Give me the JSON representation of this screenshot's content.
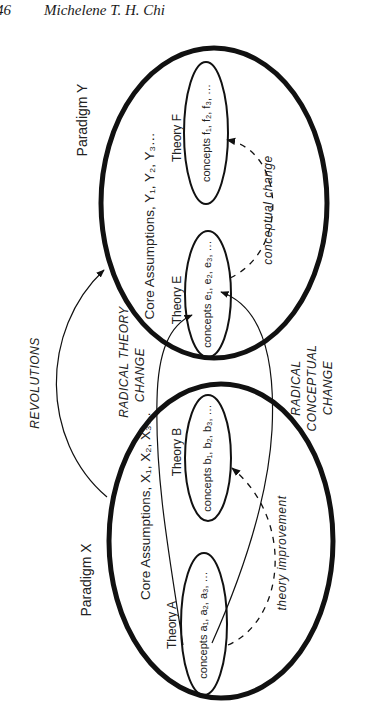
{
  "header": {
    "page_number": "46",
    "author": "Michelene T. H. Chi"
  },
  "diagram": {
    "paradigm_y": {
      "title": "Paradigm Y",
      "core_assumptions": "Core Assumptions, Y₁, Y₂, Y₃…",
      "theory_e": {
        "title": "Theory E",
        "concepts": "concepts e₁, e₂, e₃, …"
      },
      "theory_f": {
        "title": "Theory F",
        "concepts": "concepts f₁, f₂, f₃, …"
      },
      "arrow_label": "conceptual change"
    },
    "paradigm_x": {
      "title": "Paradigm X",
      "core_assumptions": "Core Assumptions, X₁, X₂, X₃…",
      "theory_a": {
        "title": "Theory A",
        "concepts": "concepts a₁, a₂, a₃, …"
      },
      "theory_b": {
        "title": "Theory B",
        "concepts": "concepts b₁, b₂, b₃, …"
      },
      "arrow_label": "theory improvement"
    },
    "links": {
      "revolutions": "REVOLUTIONS",
      "radical_theory_change_1": "RADICAL THEORY",
      "radical_theory_change_2": "CHANGE",
      "radical_conceptual_change_1": "RADICAL",
      "radical_conceptual_change_2": "CONCEPTUAL",
      "radical_conceptual_change_3": "CHANGE"
    }
  }
}
